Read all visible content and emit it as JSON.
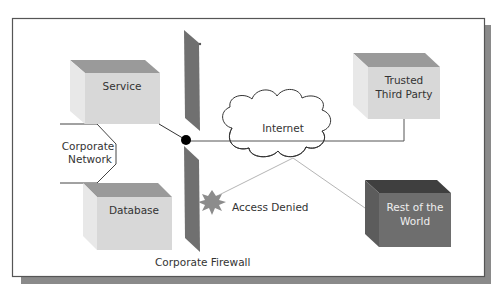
{
  "diagram": {
    "type": "network-topology",
    "nodes": {
      "service": {
        "label": "Service"
      },
      "database": {
        "label": "Database"
      },
      "trusted_third_party": {
        "line1": "Trusted",
        "line2": "Third Party"
      },
      "rest_of_world": {
        "line1": "Rest of the",
        "line2": "World"
      },
      "corporate_network": {
        "line1": "Corporate",
        "line2": "Network"
      },
      "internet": {
        "label": "Internet"
      },
      "firewall": {
        "label": "Corporate Firewall"
      },
      "access_denied": {
        "label": "Access Denied"
      }
    },
    "edges": [
      {
        "from": "Service",
        "to": "Firewall junction"
      },
      {
        "from": "Firewall junction",
        "to": "Trusted Third Party",
        "via": "Internet"
      },
      {
        "from": "Rest of the World",
        "to": "Internet"
      },
      {
        "from": "Internet",
        "to": "Access Denied",
        "note": "blocked at firewall"
      }
    ],
    "colors": {
      "frame_border": "#555555",
      "frame_shadow": "#8a8a8a",
      "box_light_front": "#d6d6d6",
      "box_light_top": "#9a9a9a",
      "box_light_side": "#e6e6e6",
      "box_dark_front": "#6e6e6e",
      "box_dark_top": "#3f3f3f",
      "firewall": "#707070",
      "starburst": "#8c8c8c",
      "link_dark": "#555555",
      "link_light": "#b5b5b5"
    }
  }
}
